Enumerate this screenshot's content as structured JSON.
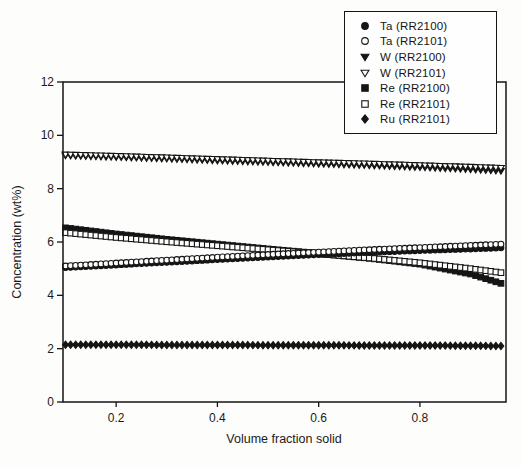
{
  "figure": {
    "background": "#fdfdfc",
    "ink_color": "#151515"
  },
  "chart_data": {
    "type": "scatter",
    "title": "",
    "xlabel": "Volume fraction solid",
    "ylabel": "Concentration (wt%)",
    "xlim": [
      0.095,
      0.97
    ],
    "ylim": [
      0,
      12
    ],
    "x_tick_labels": [
      "0.2",
      "0.4",
      "0.6",
      "0.8"
    ],
    "x_tick_values": [
      0.2,
      0.4,
      0.6,
      0.8
    ],
    "y_tick_labels": [
      "0",
      "2",
      "4",
      "6",
      "8",
      "10",
      "12"
    ],
    "y_tick_values": [
      0,
      2,
      4,
      6,
      8,
      10,
      12
    ],
    "grid": false,
    "legend_position": "top-right",
    "marker_step_x": 0.01,
    "x_start": 0.1,
    "x_end": 0.96,
    "anchors_x": [
      0.1,
      0.2,
      0.3,
      0.4,
      0.5,
      0.6,
      0.7,
      0.8,
      0.9,
      0.96
    ],
    "series": [
      {
        "name": "Ta (RR2100)",
        "marker": "circle",
        "fill": "filled",
        "values": [
          5.04,
          5.14,
          5.24,
          5.34,
          5.44,
          5.53,
          5.61,
          5.68,
          5.74,
          5.78
        ]
      },
      {
        "name": "Ta (RR2101)",
        "marker": "circle",
        "fill": "open",
        "values": [
          5.1,
          5.21,
          5.32,
          5.43,
          5.53,
          5.62,
          5.71,
          5.79,
          5.87,
          5.92
        ]
      },
      {
        "name": "W (RR2100)",
        "marker": "triangle-down",
        "fill": "filled",
        "values": [
          9.24,
          9.18,
          9.12,
          9.05,
          8.99,
          8.93,
          8.87,
          8.8,
          8.72,
          8.66
        ]
      },
      {
        "name": "W (RR2101)",
        "marker": "triangle-down",
        "fill": "open",
        "values": [
          9.28,
          9.23,
          9.17,
          9.11,
          9.05,
          8.99,
          8.94,
          8.88,
          8.82,
          8.78
        ]
      },
      {
        "name": "Re (RR2100)",
        "marker": "square",
        "fill": "filled",
        "values": [
          6.53,
          6.3,
          6.1,
          5.92,
          5.74,
          5.57,
          5.39,
          5.17,
          4.8,
          4.45
        ]
      },
      {
        "name": "Re (RR2101)",
        "marker": "square",
        "fill": "open",
        "values": [
          6.35,
          6.17,
          6.01,
          5.86,
          5.71,
          5.56,
          5.4,
          5.22,
          5.0,
          4.85
        ]
      },
      {
        "name": "Ru (RR2101)",
        "marker": "diamond",
        "fill": "filled",
        "values": [
          2.15,
          2.15,
          2.14,
          2.14,
          2.13,
          2.13,
          2.12,
          2.12,
          2.11,
          2.1
        ]
      }
    ],
    "draw_order": [
      2,
      3,
      4,
      5,
      0,
      1,
      6
    ]
  }
}
